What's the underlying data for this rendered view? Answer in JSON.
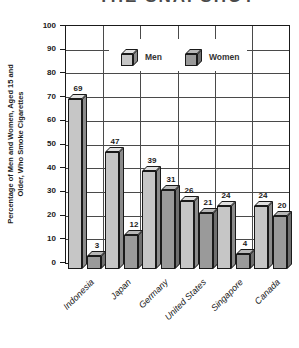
{
  "page": {
    "clipped_title": "THE SNAPSHOT"
  },
  "chart_data": {
    "type": "bar",
    "title": "",
    "categories": [
      "Indonesia",
      "Japan",
      "Germany",
      "United States",
      "Singapore",
      "Canada"
    ],
    "series": [
      {
        "name": "Men",
        "values": [
          69,
          47,
          39,
          26,
          24,
          24
        ]
      },
      {
        "name": "Women",
        "values": [
          3,
          12,
          31,
          21,
          4,
          20
        ]
      }
    ],
    "ylabel_line1": "Percentage of Men and Women, Aged 15 and",
    "ylabel_line2": "Older, Who Smoke Cigarettes",
    "xlabel": "",
    "ylim": [
      0,
      100
    ],
    "ytick_step": 10,
    "yticks": [
      0,
      10,
      20,
      30,
      40,
      50,
      60,
      70,
      80,
      90,
      100
    ],
    "grid": true,
    "bar_value_labels": true,
    "legend_position": "top-inside",
    "style": "3d-cuboid",
    "colors": {
      "men_front": "#c6c6c6",
      "men_side": "#8b8b8b",
      "men_top": "#e0e0e0",
      "women_front": "#9a9a9a",
      "women_side": "#6f6f6f",
      "women_top": "#b7b7b7",
      "outline": "#1a1a1a",
      "grid": "#4a4a4a",
      "text": "#1a1a1a"
    }
  }
}
